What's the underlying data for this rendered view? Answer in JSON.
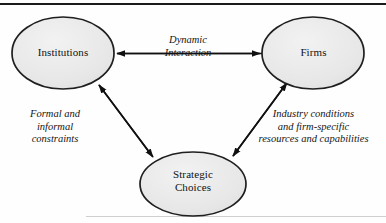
{
  "figure": {
    "type": "conceptual-diagram",
    "background_color": "#fefefe",
    "rule_color": "#1a1a1a"
  },
  "nodes": [
    {
      "id": "institutions",
      "label": "Institutions",
      "shape": "ellipse",
      "fill": "#e8e8e8",
      "stroke": "#1f1f1f",
      "cx": 63,
      "cy": 53,
      "rx": 51,
      "ry": 36
    },
    {
      "id": "firms",
      "label": "Firms",
      "shape": "ellipse",
      "fill": "#e8e8e8",
      "stroke": "#1f1f1f",
      "cx": 313,
      "cy": 53,
      "rx": 51,
      "ry": 36
    },
    {
      "id": "strategic-choices",
      "label_line1": "Strategic",
      "label_line2": "Choices",
      "shape": "ellipse",
      "fill": "#e8e8e8",
      "stroke": "#1f1f1f",
      "cx": 193,
      "cy": 184,
      "rx": 53,
      "ry": 32
    }
  ],
  "edges": [
    {
      "id": "institutions-firms",
      "from": "institutions",
      "to": "firms",
      "arrow": "double",
      "label_line1": "Dynamic",
      "label_line2": "Interaction"
    },
    {
      "id": "institutions-strategic",
      "from": "institutions",
      "to": "strategic-choices",
      "arrow": "double",
      "label_line1": "Formal and",
      "label_line2": "informal",
      "label_line3": "constraints"
    },
    {
      "id": "firms-strategic",
      "from": "strategic-choices",
      "to": "firms",
      "arrow": "double",
      "label_line1": "Industry conditions",
      "label_line2": "and firm-specific",
      "label_line3": "resources and capabilities"
    }
  ]
}
